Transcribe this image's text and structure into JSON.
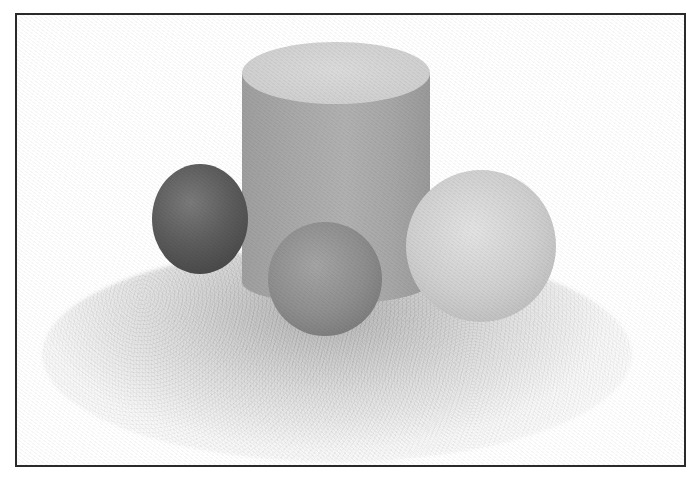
{
  "image": {
    "description": "Grayscale noisy 3D render of a cylinder with three spheres casting soft shadows on a white ground plane, enclosed in a thin dark border",
    "frame": {
      "border_color": "#2a2a2a",
      "background": "#ffffff"
    },
    "objects": [
      {
        "name": "cylinder",
        "shape": "cylinder",
        "body_color": "#a8a8a8",
        "top_color": "#d0d0d0"
      },
      {
        "name": "dark-sphere",
        "shape": "sphere",
        "color": "#5a5a5a",
        "position": "left, behind"
      },
      {
        "name": "mid-sphere",
        "shape": "sphere",
        "color": "#8c8c8c",
        "position": "center, front"
      },
      {
        "name": "light-sphere",
        "shape": "sphere",
        "color": "#cccccc",
        "position": "right"
      }
    ],
    "shadow": {
      "color": "#8a8a8a",
      "style": "soft noisy contact shadow"
    }
  }
}
